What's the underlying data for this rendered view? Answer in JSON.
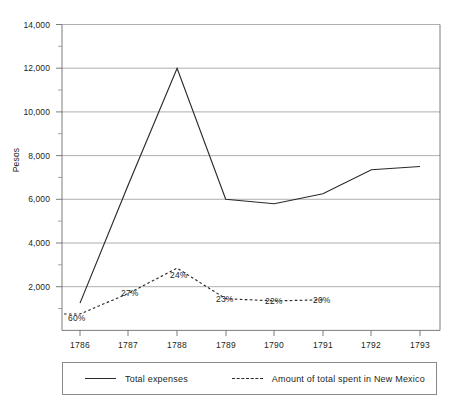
{
  "chart_data": {
    "type": "line",
    "title": "",
    "xlabel": "",
    "ylabel": "Pesos",
    "categories": [
      "1786",
      "1787",
      "1788",
      "1789",
      "1790",
      "1791",
      "1792",
      "1793"
    ],
    "ylim": [
      0,
      14000
    ],
    "ytick_labels": [
      "14,000",
      "12,000",
      "10,000",
      "8,000",
      "6,000",
      "4,000",
      "2,000"
    ],
    "ytick_values": [
      14000,
      12000,
      10000,
      8000,
      6000,
      4000,
      2000
    ],
    "ytick_interval": 2000,
    "minor_ticks": true,
    "grid": "horizontal",
    "legend_position": "bottom",
    "series": [
      {
        "name": "Total expenses",
        "style": "solid",
        "values": [
          1250,
          6700,
          12000,
          6000,
          5800,
          6250,
          7350,
          7500
        ]
      },
      {
        "name": "Amount of total spent in New Mexico",
        "style": "dashed",
        "values": [
          750,
          1700,
          2850,
          1450,
          1350,
          1400,
          null,
          null
        ]
      }
    ],
    "annotations": [
      {
        "label": "60%",
        "category": "1786"
      },
      {
        "label": "27%",
        "category": "1787"
      },
      {
        "label": "24%",
        "category": "1788"
      },
      {
        "label": "23%",
        "category": "1789"
      },
      {
        "label": "22%",
        "category": "1790"
      },
      {
        "label": "20%",
        "category": "1791"
      }
    ]
  },
  "legend": {
    "entries": [
      {
        "label": "Total expenses",
        "style": "solid"
      },
      {
        "label": "Amount of total spent in New Mexico",
        "style": "dashed"
      }
    ]
  },
  "axis": {
    "y_title": "Pesos",
    "y_ticks": [
      "14,000",
      "12,000",
      "10,000",
      "8,000",
      "6,000",
      "4,000",
      "2,000"
    ],
    "x_ticks": [
      "1786",
      "1787",
      "1788",
      "1789",
      "1790",
      "1791",
      "1792",
      "1793"
    ]
  },
  "annotations": {
    "a0": "60%",
    "a1": "27%",
    "a2": "24%",
    "a3": "23%",
    "a4": "22%",
    "a5": "20%"
  },
  "colors": {
    "line": "#2a2a2a",
    "grid": "#9a9a9a",
    "axis": "#6e6e6e",
    "text": "#231f20"
  }
}
